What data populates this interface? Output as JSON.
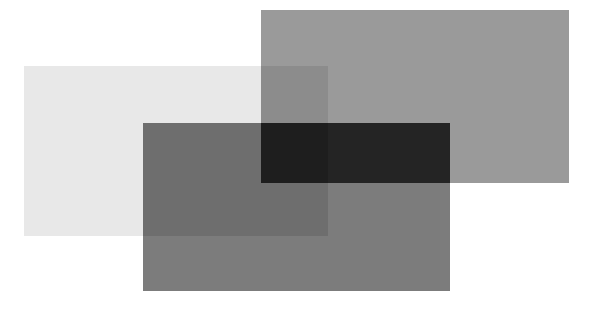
{
  "diagram": {
    "background": "#ffffff",
    "regions": [
      {
        "name": "light-rect",
        "x": 24,
        "y": 66,
        "w": 304,
        "h": 170,
        "color": "#e8e8e8"
      },
      {
        "name": "top-right-rect",
        "x": 261,
        "y": 10,
        "w": 308,
        "h": 173,
        "color": "#9a9a9a"
      },
      {
        "name": "light-top-right-overlap",
        "x": 261,
        "y": 66,
        "w": 67,
        "h": 117,
        "color": "#8c8c8c"
      },
      {
        "name": "bottom-center-rect",
        "x": 143,
        "y": 123,
        "w": 307,
        "h": 168,
        "color": "#7c7c7c"
      },
      {
        "name": "light-bottom-overlap",
        "x": 143,
        "y": 123,
        "w": 185,
        "h": 113,
        "color": "#6e6e6e"
      },
      {
        "name": "top-right-bottom-overlap",
        "x": 261,
        "y": 123,
        "w": 189,
        "h": 60,
        "color": "#242424"
      },
      {
        "name": "triple-overlap",
        "x": 261,
        "y": 123,
        "w": 67,
        "h": 60,
        "color": "#1e1e1e"
      }
    ]
  }
}
